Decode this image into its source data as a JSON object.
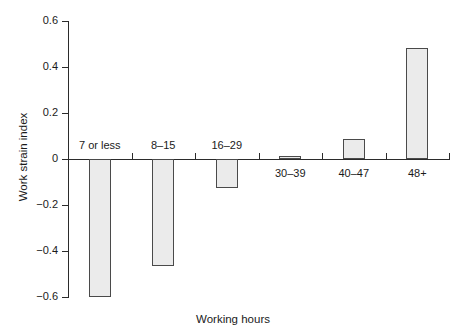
{
  "chart_data": {
    "type": "bar",
    "title": "",
    "xlabel": "Working hours",
    "ylabel": "Work strain index",
    "categories": [
      "7 or less",
      "8–15",
      "16–29",
      "30–39",
      "40–47",
      "48+"
    ],
    "values": [
      -0.6,
      -0.465,
      -0.125,
      0.015,
      0.087,
      0.483
    ],
    "ylim": [
      -0.6,
      0.6
    ],
    "ytick_labels": [
      "0.6",
      "0.4",
      "0.2",
      "0",
      "−0.2",
      "−0.4",
      "−0.6"
    ],
    "ytick_values": [
      0.6,
      0.4,
      0.2,
      0,
      -0.2,
      -0.4,
      -0.6
    ],
    "grid": false,
    "legend": "none",
    "bar_fill": "#ebebeb",
    "bar_stroke": "#4a4a4a",
    "axis_color": "#2b2b2b",
    "background": "#ffffff"
  }
}
